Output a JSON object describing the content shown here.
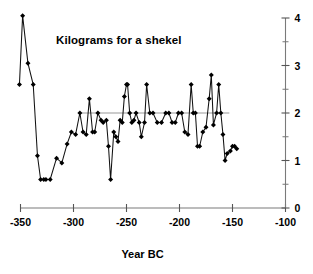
{
  "chart": {
    "title": "Kilograms for a shekel",
    "xlabel": "Year BC",
    "ylabel": ""
  },
  "chart_data": {
    "type": "line",
    "title": "Kilograms for a shekel",
    "subtitle": "",
    "xlabel": "Year BC",
    "ylabel": "",
    "xlim": [
      -350,
      -100
    ],
    "ylim": [
      0,
      4
    ],
    "xticks": [
      -350,
      -300,
      -250,
      -200,
      -150,
      -100
    ],
    "xticklabels": [
      "-350",
      "-300",
      "-250",
      "-200",
      "-150",
      "-100"
    ],
    "yticks": [
      0,
      1,
      2,
      3,
      4
    ],
    "yticklabels": [
      "0",
      "1",
      "2",
      "3",
      "4"
    ],
    "yticks_minor": [
      0.5,
      1.5,
      2.5,
      3.5
    ],
    "y_axis_position": "right",
    "grid": false,
    "legend": null,
    "annotations": [
      {
        "type": "hline",
        "y": 2.0,
        "x_start": -294,
        "x_end": -153,
        "color": "#9a9a9a"
      }
    ],
    "marker": "diamond",
    "line_color": "#111111",
    "series": [
      {
        "name": "Kilograms for a shekel",
        "x": [
          -351,
          -348,
          -343,
          -338,
          -334,
          -331,
          -328,
          -326,
          -322,
          -316,
          -311,
          -306,
          -302,
          -298,
          -294,
          -291,
          -288,
          -285,
          -282,
          -280,
          -277,
          -274,
          -272,
          -269,
          -267,
          -265,
          -262,
          -260,
          -258,
          -256,
          -254,
          -252,
          -250,
          -249,
          -247,
          -245,
          -243,
          -241,
          -238,
          -236,
          -233,
          -231,
          -228,
          -225,
          -221,
          -217,
          -213,
          -210,
          -207,
          -204,
          -201,
          -198,
          -195,
          -192,
          -189,
          -187,
          -185,
          -183,
          -181,
          -178,
          -175,
          -172,
          -170,
          -168,
          -165,
          -163,
          -161,
          -159,
          -157,
          -155,
          -152,
          -150,
          -148,
          -146
        ],
        "y": [
          2.6,
          4.05,
          3.05,
          2.6,
          1.1,
          0.6,
          0.6,
          0.6,
          0.6,
          1.05,
          0.95,
          1.35,
          1.6,
          1.55,
          2.0,
          1.6,
          1.55,
          2.3,
          1.6,
          1.6,
          2.0,
          1.85,
          1.8,
          1.85,
          1.3,
          0.6,
          1.6,
          1.5,
          1.4,
          1.85,
          1.8,
          2.35,
          2.6,
          2.6,
          2.0,
          1.8,
          1.85,
          2.0,
          1.8,
          1.5,
          1.8,
          2.6,
          2.0,
          2.0,
          1.8,
          1.8,
          2.0,
          2.0,
          1.8,
          1.8,
          2.0,
          2.0,
          1.6,
          1.55,
          2.6,
          2.0,
          2.0,
          1.3,
          1.3,
          1.6,
          1.7,
          2.3,
          2.8,
          1.75,
          2.0,
          2.6,
          2.0,
          1.55,
          1.0,
          1.15,
          1.2,
          1.3,
          1.3,
          1.25
        ]
      }
    ]
  }
}
